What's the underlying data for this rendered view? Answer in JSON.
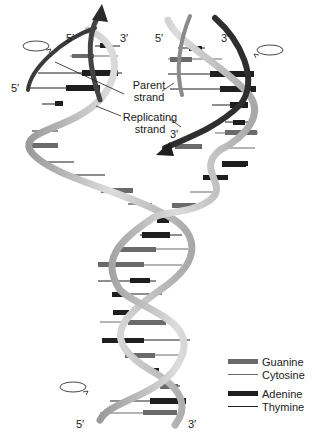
{
  "diagram": {
    "end_labels": {
      "top_left_strand_5": "5′",
      "top_left_strand_3": "3′",
      "top_right_strand_5": "5′",
      "top_right_strand_3": "3′",
      "left_outer_5": "5′",
      "replicating_3": "3′",
      "bottom_5": "5′",
      "bottom_3": "3′"
    },
    "callouts": {
      "parent_line1": "Parent",
      "parent_line2": "strand",
      "replicating_line1": "Replicating",
      "replicating_line2": "strand"
    },
    "icons": [
      "rotation-arrow-top-left",
      "rotation-arrow-top-right",
      "rotation-arrow-bottom-left"
    ]
  },
  "legend": {
    "items": [
      {
        "label": "Guanine",
        "style": "thick",
        "color": "#6a6a6a"
      },
      {
        "label": "Cytosine",
        "style": "thin",
        "color": "#6a6a6a"
      },
      {
        "label": "Adenine",
        "style": "thick",
        "color": "#1e1e1e"
      },
      {
        "label": "Thymine",
        "style": "thin",
        "color": "#1e1e1e"
      }
    ]
  },
  "colors": {
    "backbone_light": "#c8c8c8",
    "backbone_dark": "#3a3a3a",
    "guanine": "#6a6a6a",
    "adenine": "#1e1e1e"
  }
}
